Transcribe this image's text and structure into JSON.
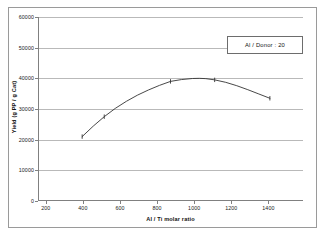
{
  "figure": {
    "background_color": "#ffffff",
    "frame_color": "#9a9a9a"
  },
  "chart_data": {
    "type": "line",
    "title": "",
    "xlabel": "Al / Ti molar ratio",
    "ylabel": "Yield (g PP / g Cat)",
    "xlim": [
      200,
      1400
    ],
    "ylim": [
      0,
      60000
    ],
    "xticks": [
      200,
      400,
      600,
      800,
      1000,
      1200,
      1400
    ],
    "xtick_labels": [
      "200",
      "400",
      "600",
      "800",
      "1000",
      "1200",
      "1400"
    ],
    "yticks": [
      0,
      10000,
      20000,
      30000,
      40000,
      50000,
      60000
    ],
    "ytick_labels": [
      "0",
      "10000",
      "20000",
      "30000",
      "40000",
      "50000",
      "60000"
    ],
    "grid": "horizontal",
    "legend_position": "upper-right",
    "series": [
      {
        "name": "Al / Donor : 20",
        "color": "#333333",
        "marker": "tick",
        "x": [
          400,
          500,
          800,
          1000,
          1250
        ],
        "values": [
          21000,
          27500,
          39000,
          39500,
          33500
        ],
        "curve_x": [
          400,
          450,
          500,
          550,
          600,
          650,
          700,
          750,
          800,
          850,
          900,
          930,
          960,
          1000,
          1050,
          1100,
          1150,
          1200,
          1250
        ],
        "curve_y": [
          21000,
          24400,
          27500,
          30200,
          32500,
          34500,
          36200,
          37700,
          39000,
          39600,
          39950,
          40000,
          39900,
          39500,
          38700,
          37600,
          36300,
          34900,
          33500
        ]
      }
    ],
    "annotations": [
      {
        "name": "legend-label",
        "text": "Al / Donor : 20"
      }
    ]
  }
}
